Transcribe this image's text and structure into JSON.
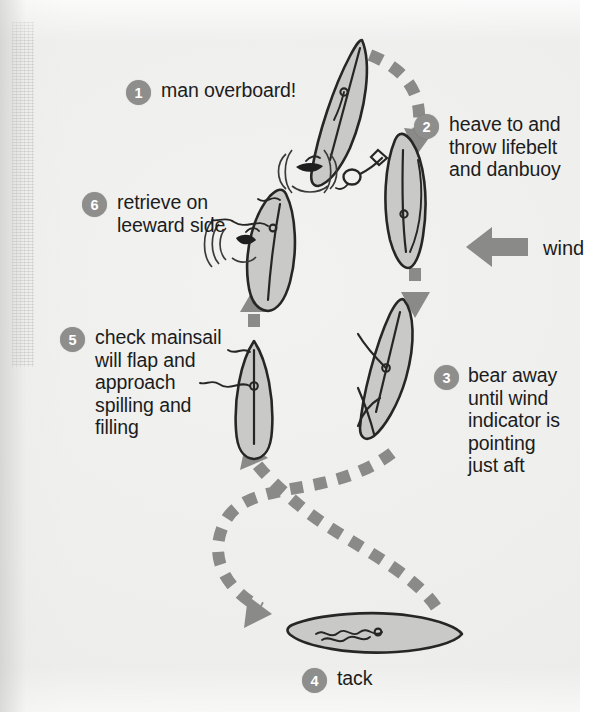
{
  "diagram": {
    "colors": {
      "page": "#efefee",
      "badge": "#8e8e8c",
      "hull_fill": "#c9c9c7",
      "hull_stroke": "#2b2b2b",
      "arrow": "#8a8a88",
      "text": "#1c1c1c"
    },
    "wind": {
      "label": "wind",
      "direction": "from right to left",
      "arrow_icon": "wind-arrow-left"
    },
    "steps": [
      {
        "number": "1",
        "text": "man overboard!",
        "badge_x": 126,
        "badge_y": 80,
        "label_x": 161,
        "label_y": 79
      },
      {
        "number": "2",
        "text": "heave to and\nthrow lifebelt\nand danbuoy",
        "badge_x": 414,
        "badge_y": 114,
        "label_x": 449,
        "label_y": 113
      },
      {
        "number": "3",
        "text": "bear away\nuntil wind\nindicator is\npointing\njust aft",
        "badge_x": 434,
        "badge_y": 365,
        "label_x": 468,
        "label_y": 364
      },
      {
        "number": "4",
        "text": "tack",
        "badge_x": 302,
        "badge_y": 668,
        "label_x": 337,
        "label_y": 667
      },
      {
        "number": "5",
        "text": "check mainsail\nwill flap and\napproach\nspilling and\nfilling",
        "badge_x": 60,
        "badge_y": 327,
        "label_x": 95,
        "label_y": 326
      },
      {
        "number": "6",
        "text": "retrieve on\nleeward side",
        "badge_x": 82,
        "badge_y": 192,
        "label_x": 117,
        "label_y": 191
      }
    ],
    "boats": [
      {
        "name": "boat-step-1",
        "state": "close hauled, sailing away"
      },
      {
        "name": "boat-step-2",
        "state": "hove to"
      },
      {
        "name": "boat-step-3",
        "state": "bearing away, boom out"
      },
      {
        "name": "boat-step-4",
        "state": "tacking, sails flapping"
      },
      {
        "name": "boat-step-5",
        "state": "approaching, mainsail flapping"
      },
      {
        "name": "boat-step-6",
        "state": "stopped alongside casualty"
      }
    ],
    "water_objects": [
      {
        "name": "person-in-water-overboard"
      },
      {
        "name": "danbuoy-and-lifebelt"
      },
      {
        "name": "person-in-water-retrieved"
      }
    ],
    "paths": [
      {
        "name": "path-1-to-2",
        "style": "dashed-arrow"
      },
      {
        "name": "path-2-to-3",
        "style": "dashed-arrow"
      },
      {
        "name": "path-3-to-4",
        "style": "dashed-arrow"
      },
      {
        "name": "path-4-to-5",
        "style": "dashed-arrow"
      },
      {
        "name": "path-5-to-6",
        "style": "dashed-arrow"
      }
    ]
  }
}
